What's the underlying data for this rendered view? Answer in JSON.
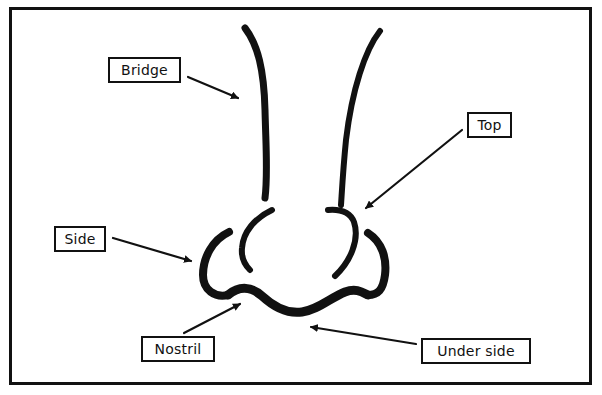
{
  "diagram": {
    "colors": {
      "ink": "#111111",
      "background": "#ffffff"
    },
    "labels": [
      {
        "id": "bridge",
        "text": "Bridge",
        "x": 108,
        "y": 57,
        "w": 73,
        "h": 26
      },
      {
        "id": "top",
        "text": "Top",
        "x": 467,
        "y": 112,
        "w": 45,
        "h": 26
      },
      {
        "id": "side",
        "text": "Side",
        "x": 54,
        "y": 226,
        "w": 52,
        "h": 26
      },
      {
        "id": "nostril",
        "text": "Nostril",
        "x": 141,
        "y": 336,
        "w": 74,
        "h": 26
      },
      {
        "id": "under_side",
        "text": "Under side",
        "x": 421,
        "y": 338,
        "w": 110,
        "h": 26
      }
    ]
  }
}
